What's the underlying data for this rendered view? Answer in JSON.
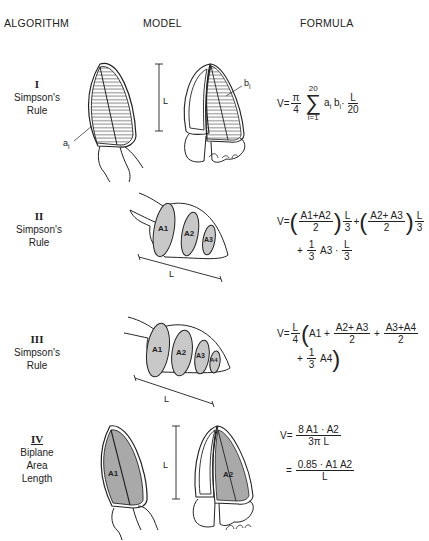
{
  "headers": {
    "algorithm": "ALGORITHM",
    "model": "MODEL",
    "formula": "FORMULA"
  },
  "rows": [
    {
      "numeral": "I",
      "name_line1": "Simpson's",
      "name_line2": "Rule",
      "labels": {
        "a": "a",
        "a_sub": "i",
        "b": "b",
        "b_sub": "i",
        "L": "L"
      },
      "formula": {
        "lhs": "V=",
        "pi_num": "π",
        "pi_den": "4",
        "sum_top": "20",
        "sum_sym": "∑",
        "sum_bottom": "i=1",
        "term": "a",
        "term_sub": "i",
        "term2": "b",
        "term2_sub": "i",
        "dot": "·",
        "L_num": "L",
        "L_den": "20"
      }
    },
    {
      "numeral": "II",
      "name_line1": "Simpson's",
      "name_line2": "Rule",
      "labels": {
        "A1": "A1",
        "A2": "A2",
        "A3": "A3",
        "L": "L"
      },
      "formula": {
        "lhs": "V=",
        "f1_num": "A1+A2",
        "f1_den": "2",
        "L1_num": "L",
        "L1_den": "3",
        "plus": "+",
        "f2_num": "A2+ A3",
        "f2_den": "2",
        "L2_num": "L",
        "L2_den": "3",
        "line2_plus": "+",
        "third_num": "1",
        "third_den": "3",
        "A3": "A3",
        "dot": "·",
        "L3_num": "L",
        "L3_den": "3"
      }
    },
    {
      "numeral": "III",
      "name_line1": "Simpson's",
      "name_line2": "Rule",
      "labels": {
        "A1": "A1",
        "A2": "A2",
        "A3": "A3",
        "A4": "A4",
        "L": "L"
      },
      "formula": {
        "lhs": "V=",
        "L_num": "L",
        "L_den": "4",
        "A1": "A1 +",
        "f1_num": "A2+ A3",
        "f1_den": "2",
        "plus": "+",
        "f2_num": "A3+A4",
        "f2_den": "2",
        "line2_plus": "+",
        "third_num": "1",
        "third_den": "3",
        "A4": "A4"
      }
    },
    {
      "numeral": "IV",
      "name_line1": "Biplane",
      "name_line2": "Area",
      "name_line3": "Length",
      "labels": {
        "A1": "A1",
        "A2": "A2",
        "L": "L"
      },
      "formula": {
        "lhs": "V=",
        "f1_num": "8 A1 · A2",
        "f1_den": "3π L",
        "eq2": "=",
        "f2_num": "0.85 · A1 A2",
        "f2_den": "L"
      }
    }
  ],
  "colors": {
    "ink": "#222222",
    "shade": "#c8c8c8",
    "shade_dark": "#a9a9a9",
    "background": "#ffffff"
  }
}
